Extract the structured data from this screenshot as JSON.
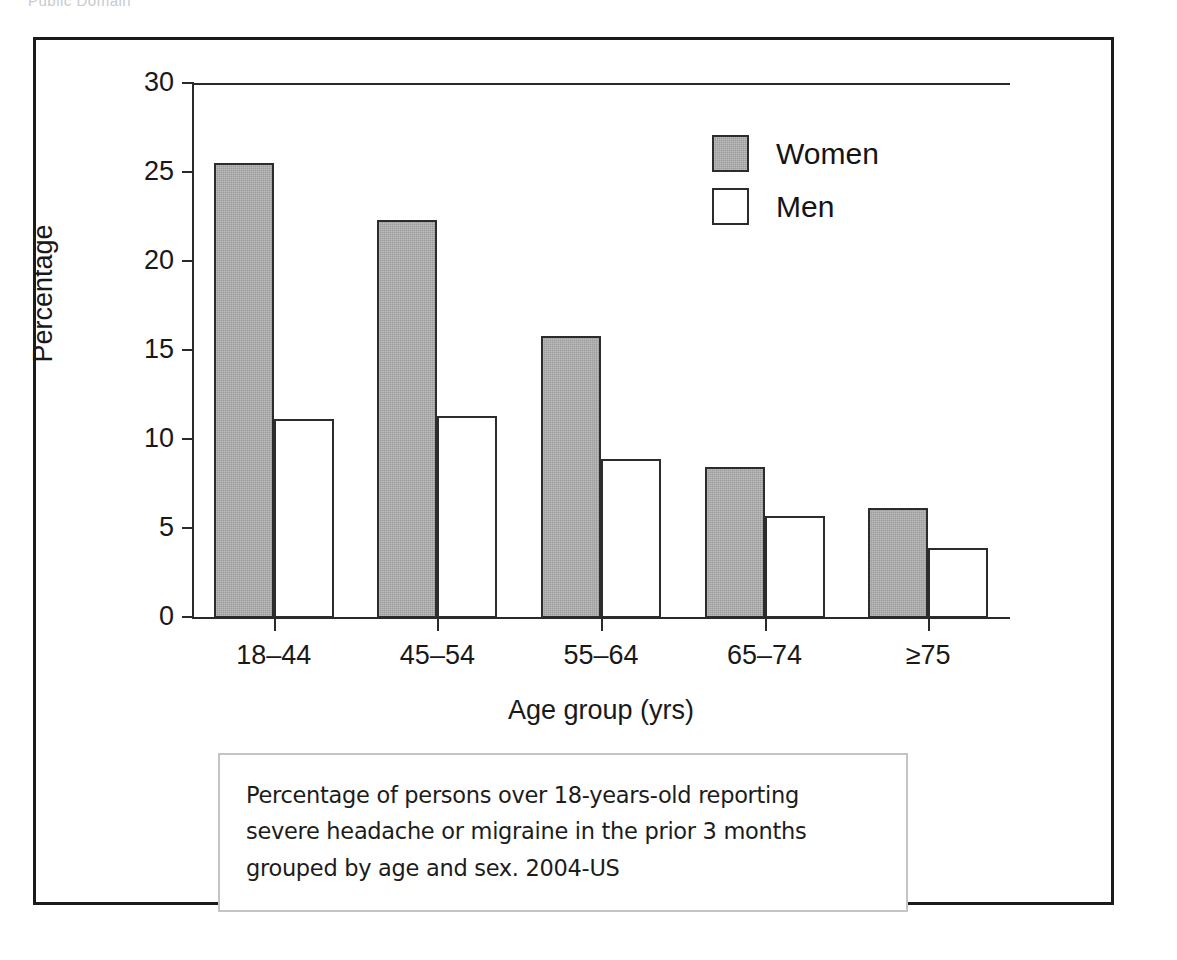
{
  "attribution": "Public Domain",
  "chart_data": {
    "type": "bar",
    "title": "",
    "xlabel": "Age group (yrs)",
    "ylabel": "Percentage",
    "categories": [
      "18–44",
      "45–54",
      "55–64",
      "65–74",
      "≥75"
    ],
    "series": [
      {
        "name": "Women",
        "color": "#9d9d9d",
        "values": [
          25.5,
          22.3,
          15.8,
          8.4,
          6.1
        ]
      },
      {
        "name": "Men",
        "color": "#ffffff",
        "values": [
          11.1,
          11.3,
          8.9,
          5.7,
          3.9
        ]
      }
    ],
    "ylim": [
      0,
      30
    ],
    "yticks": [
      0,
      5,
      10,
      15,
      20,
      25,
      30
    ],
    "ytick_labels": [
      "0",
      "5",
      "10",
      "15",
      "20",
      "25",
      "30"
    ],
    "grid": false,
    "legend_position": "top-right"
  },
  "legend": {
    "items": [
      {
        "label": "Women"
      },
      {
        "label": "Men"
      }
    ]
  },
  "caption": {
    "line1": "Percentage of persons over 18-years-old reporting",
    "line2": "severe headache or migraine in the prior 3 months",
    "line3": "grouped by age and sex. 2004-US"
  }
}
